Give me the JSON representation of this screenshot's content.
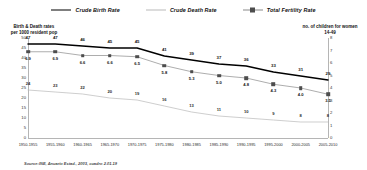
{
  "legend": {
    "items": [
      {
        "label": "Crude Birth Rate",
        "icon": "line-swatch-icon",
        "color": "#000000"
      },
      {
        "label": "Crude Death Rate",
        "icon": "line-swatch-icon",
        "color": "#b9b9b9"
      },
      {
        "label": "Total Fertility Rate",
        "icon": "line-marker-swatch-icon",
        "color": "#8a8a8a"
      }
    ]
  },
  "source": {
    "text": "Source:INE, Anuario Estad., 2003, cuadro 2.01.19"
  },
  "chart_data": {
    "type": "line",
    "title": "",
    "xlabel": "",
    "ylabel": "Birth & Death rates\nper 1000 resident pop",
    "y2label": "no. of children for women\n14-49",
    "ylim": [
      0,
      50
    ],
    "y2lim": [
      0,
      8
    ],
    "yticks": [
      0,
      5,
      10,
      15,
      20,
      25,
      30,
      35,
      40,
      45,
      50
    ],
    "y2ticks": [
      0,
      1,
      2,
      3,
      4,
      5,
      6,
      7,
      8
    ],
    "grid": false,
    "legend_position": "top-center",
    "categories": [
      "1950-1955",
      "1955-1960",
      "1960-1965",
      "1965-1970",
      "1970-1975",
      "1975-1980",
      "1980-1985",
      "1985-1990",
      "1990-1995",
      "1995-2000",
      "2000-2005",
      "2005-2010"
    ],
    "series": [
      {
        "name": "Crude Birth Rate",
        "axis": "left",
        "color": "#000000",
        "values": [
          47,
          47,
          46,
          45,
          45,
          41,
          39,
          37,
          36,
          33,
          31,
          29
        ],
        "labels": [
          "47",
          "47",
          "46",
          "45",
          "45",
          "41",
          "39",
          "37",
          "36",
          "33",
          "31",
          "29"
        ]
      },
      {
        "name": "Crude Death Rate",
        "axis": "left",
        "color": "#b9b9b9",
        "values": [
          24,
          23,
          22,
          20,
          19,
          16,
          13,
          11,
          10,
          9,
          8,
          8
        ],
        "labels": [
          "24",
          "23",
          "22",
          "20",
          "19",
          "16",
          "13",
          "11",
          "10",
          "9",
          "8",
          "8"
        ]
      },
      {
        "name": "Total Fertility Rate",
        "axis": "right",
        "color": "#8a8a8a",
        "values": [
          6.9,
          6.9,
          6.6,
          6.6,
          6.5,
          5.8,
          5.3,
          5.0,
          4.8,
          4.3,
          4.0,
          3.5
        ],
        "labels": [
          "6.9",
          "6.9",
          "6.6",
          "6.6",
          "6.5",
          "5.8",
          "5.3",
          "5.0",
          "4.8",
          "4.3",
          "4.0",
          "3.5"
        ]
      }
    ]
  }
}
